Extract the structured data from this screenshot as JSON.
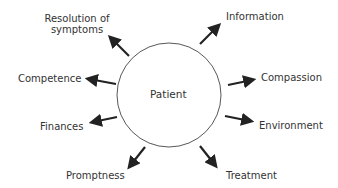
{
  "diagram": {
    "center": {
      "label": "Patient"
    },
    "nodes": [
      {
        "id": "resolution",
        "label_line1": "Resolution of",
        "label_line2": "symptoms"
      },
      {
        "id": "information",
        "label": "Information"
      },
      {
        "id": "competence",
        "label": "Competence"
      },
      {
        "id": "compassion",
        "label": "Compassion"
      },
      {
        "id": "finances",
        "label": "Finances"
      },
      {
        "id": "environment",
        "label": "Environment"
      },
      {
        "id": "promptness",
        "label": "Promptness"
      },
      {
        "id": "treatment",
        "label": "Treatment"
      }
    ],
    "colors": {
      "stroke": "#222222",
      "text": "#333333",
      "background": "#ffffff"
    }
  }
}
